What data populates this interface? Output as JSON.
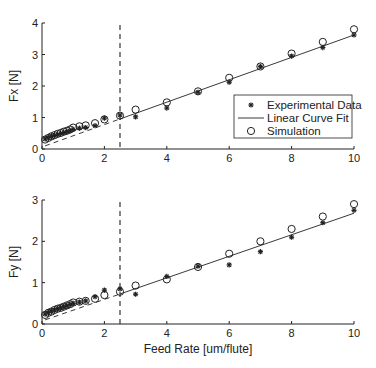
{
  "chart_data": [
    {
      "type": "scatter",
      "title": "",
      "xlabel": "",
      "ylabel": "Fx [N]",
      "xlim": [
        0,
        10
      ],
      "ylim": [
        0,
        4
      ],
      "xticks": [
        0,
        2,
        4,
        6,
        8,
        10
      ],
      "yticks": [
        0,
        1,
        2,
        3,
        4
      ],
      "grid": false,
      "legend_position": "lower right (inside)",
      "vertical_dashed_line_x": 2.5,
      "fit_line": {
        "x": [
          0.1,
          10
        ],
        "y": [
          0.1,
          3.62
        ],
        "dashed_below_x": 2.5
      },
      "series": [
        {
          "name": "Experimental Data",
          "marker": "*",
          "x": [
            0.1,
            0.2,
            0.3,
            0.4,
            0.5,
            0.6,
            0.7,
            0.8,
            0.9,
            1.0,
            1.2,
            1.4,
            1.7,
            2.0,
            2.5,
            3,
            4,
            5,
            6,
            7,
            8,
            9,
            10
          ],
          "y": [
            0.32,
            0.36,
            0.4,
            0.43,
            0.46,
            0.49,
            0.52,
            0.55,
            0.58,
            0.62,
            0.66,
            0.68,
            0.74,
            0.98,
            1.08,
            1.02,
            1.3,
            1.8,
            2.12,
            2.62,
            2.95,
            3.22,
            3.62
          ]
        },
        {
          "name": "Linear Curve Fit",
          "marker": "line"
        },
        {
          "name": "Simulation",
          "marker": "o",
          "x": [
            0.1,
            0.2,
            0.3,
            0.4,
            0.5,
            0.6,
            0.7,
            0.8,
            0.9,
            1.0,
            1.2,
            1.4,
            1.7,
            2.0,
            2.5,
            3,
            4,
            5,
            6,
            7,
            8,
            9,
            10
          ],
          "y": [
            0.3,
            0.35,
            0.4,
            0.44,
            0.48,
            0.51,
            0.55,
            0.58,
            0.62,
            0.68,
            0.72,
            0.75,
            0.82,
            0.94,
            1.06,
            1.25,
            1.48,
            1.83,
            2.26,
            2.62,
            3.03,
            3.4,
            3.8
          ]
        }
      ]
    },
    {
      "type": "scatter",
      "title": "",
      "xlabel": "Feed Rate [um/flute]",
      "ylabel": "Fy [N]",
      "xlim": [
        0,
        10
      ],
      "ylim": [
        0,
        3
      ],
      "xticks": [
        0,
        2,
        4,
        6,
        8,
        10
      ],
      "yticks": [
        0,
        1,
        2,
        3
      ],
      "grid": false,
      "vertical_dashed_line_x": 2.5,
      "fit_line": {
        "x": [
          0.1,
          10
        ],
        "y": [
          0.1,
          2.68
        ],
        "dashed_below_x": 2.5
      },
      "series": [
        {
          "name": "Experimental Data",
          "marker": "*",
          "x": [
            0.1,
            0.2,
            0.3,
            0.4,
            0.5,
            0.6,
            0.7,
            0.8,
            0.9,
            1.0,
            1.2,
            1.4,
            1.7,
            2.0,
            2.5,
            3,
            4,
            5,
            6,
            7,
            8,
            9,
            10
          ],
          "y": [
            0.24,
            0.28,
            0.31,
            0.34,
            0.37,
            0.39,
            0.42,
            0.44,
            0.47,
            0.5,
            0.53,
            0.56,
            0.66,
            0.82,
            0.85,
            0.72,
            1.15,
            1.4,
            1.43,
            1.75,
            2.1,
            2.45,
            2.75
          ]
        },
        {
          "name": "Linear Curve Fit",
          "marker": "line"
        },
        {
          "name": "Simulation",
          "marker": "o",
          "x": [
            0.1,
            0.2,
            0.3,
            0.4,
            0.5,
            0.6,
            0.7,
            0.8,
            0.9,
            1.0,
            1.2,
            1.4,
            1.7,
            2.0,
            2.5,
            3,
            4,
            5,
            6,
            7,
            8,
            9,
            10
          ],
          "y": [
            0.22,
            0.27,
            0.3,
            0.34,
            0.37,
            0.39,
            0.42,
            0.45,
            0.48,
            0.52,
            0.54,
            0.56,
            0.61,
            0.7,
            0.78,
            0.93,
            1.08,
            1.38,
            1.7,
            2.0,
            2.3,
            2.6,
            2.9
          ]
        }
      ]
    }
  ],
  "legend": {
    "items": [
      {
        "label": "Experimental Data",
        "marker": "star"
      },
      {
        "label": "Linear Curve Fit",
        "marker": "line"
      },
      {
        "label": "Simulation",
        "marker": "circle"
      }
    ]
  },
  "layout": {
    "top": {
      "x0px": 42,
      "x1px": 354,
      "y0px": 149,
      "ymaxpx": 23
    },
    "bottom": {
      "x0px": 42,
      "x1px": 354,
      "y0px": 324,
      "ymaxpx": 200
    }
  },
  "colors": {
    "ink": "#222222",
    "line": "#333333",
    "background": "#ffffff"
  }
}
